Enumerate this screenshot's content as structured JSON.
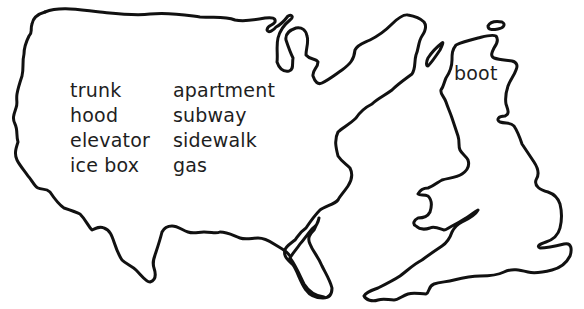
{
  "maps": {
    "usa": {
      "label": "United States outline",
      "words_left": [
        "trunk",
        "hood",
        "elevator",
        "ice box"
      ],
      "words_right": [
        "apartment",
        "subway",
        "sidewalk",
        "gas"
      ]
    },
    "uk": {
      "label": "Great Britain outline",
      "words": [
        "boot"
      ]
    }
  },
  "colors": {
    "outline": "#111111",
    "text": "#1e1e1e",
    "background": "#ffffff"
  }
}
